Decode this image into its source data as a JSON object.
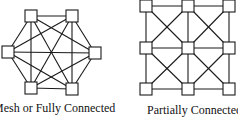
{
  "diagrams": [
    {
      "id": "mesh",
      "label": "Mesh or Fully Connected",
      "nodes": [
        {
          "x": 31,
          "y": 16
        },
        {
          "x": 72,
          "y": 16
        },
        {
          "x": 95,
          "y": 53
        },
        {
          "x": 72,
          "y": 89
        },
        {
          "x": 31,
          "y": 88
        },
        {
          "x": 8,
          "y": 52
        }
      ],
      "topology": "full"
    },
    {
      "id": "partial",
      "label": "Partially Connected",
      "grid": {
        "cols": [
          146,
          188,
          229
        ],
        "rows": [
          6,
          48,
          89
        ]
      },
      "topology": "grid-with-cell-diagonals"
    }
  ],
  "colors": {
    "line": "#1a1a1a",
    "node_fill": "#ffffff",
    "background": "#ffffff"
  }
}
